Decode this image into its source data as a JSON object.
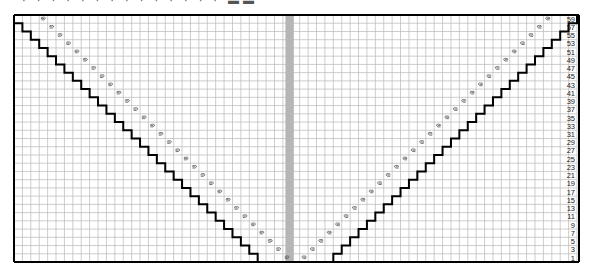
{
  "title_fragment": "· · · · · · · · · · · · · · ▬▬",
  "chart": {
    "type": "knitting-chart",
    "columns": 67,
    "rows": 30,
    "row_labels": [
      "59",
      "57",
      "55",
      "53",
      "51",
      "49",
      "47",
      "45",
      "43",
      "41",
      "39",
      "37",
      "35",
      "33",
      "31",
      "29",
      "27",
      "25",
      "23",
      "21",
      "19",
      "17",
      "15",
      "13",
      "11",
      "9",
      "7",
      "5",
      "3",
      "1"
    ],
    "center_column_index": 33,
    "left_staircase_start_col": 1,
    "right_staircase_start_col": 36,
    "symbol": "decrease-mark",
    "colors": {
      "grid": "#b8b8b8",
      "outline": "#000000",
      "center_column": "#b5b5b5",
      "symbol": "#555555"
    }
  }
}
